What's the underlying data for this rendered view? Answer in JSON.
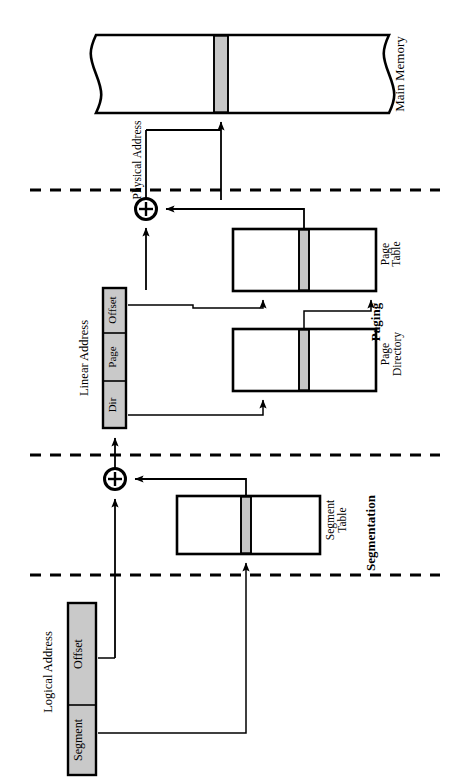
{
  "diagram": {
    "orientation": "rotated-90",
    "sections": [
      {
        "name": "paging",
        "label": "Paging"
      },
      {
        "name": "segmentation",
        "label": "Segmentation"
      }
    ],
    "main_memory": {
      "label": "Main Memory",
      "band_color": "#c6c6c6"
    },
    "physical_address": {
      "label": "Physical Address"
    },
    "linear_address": {
      "label": "Linear Address",
      "fields": [
        "Dir",
        "Page",
        "Offset"
      ]
    },
    "logical_address": {
      "label": "Logical Address",
      "fields": [
        "Segment",
        "Offset"
      ]
    },
    "tables": [
      {
        "name": "page-table",
        "label_line1": "Page",
        "label_line2": "Table"
      },
      {
        "name": "page-directory",
        "label_line1": "Page",
        "label_line2": "Directory"
      },
      {
        "name": "segment-table",
        "label_line1": "Segment",
        "label_line2": "Table"
      }
    ],
    "adders": [
      {
        "name": "paging-adder",
        "symbol": "+"
      },
      {
        "name": "segmentation-adder",
        "symbol": "+"
      }
    ],
    "colors": {
      "stroke": "#000000",
      "fill": "#ffffff",
      "band_gray": "#c6c6c6",
      "address_gray": "#c9c9c9"
    }
  }
}
